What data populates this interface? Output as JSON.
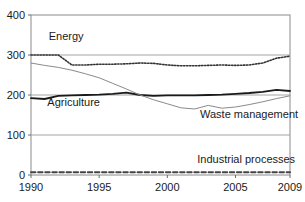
{
  "chart_data": {
    "type": "line",
    "title": "",
    "subtitle": "",
    "xlabel": "",
    "ylabel": "",
    "xlim": [
      1990,
      2009
    ],
    "ylim": [
      0,
      400
    ],
    "yticks": [
      0,
      100,
      200,
      300,
      400
    ],
    "ytick_labels": [
      "0",
      "100",
      "200",
      "300",
      "400"
    ],
    "xticks": [
      1990,
      1995,
      2000,
      2005,
      2009
    ],
    "xtick_labels": [
      "1990",
      "1995",
      "2000",
      "2005",
      "2009"
    ],
    "grid": "horizontal",
    "legend_position": "inline-annotations",
    "x": [
      1990,
      1991,
      1992,
      1993,
      1994,
      1995,
      1996,
      1997,
      1998,
      1999,
      2000,
      2001,
      2002,
      2003,
      2004,
      2005,
      2006,
      2007,
      2008,
      2009
    ],
    "series": [
      {
        "name": "Energy",
        "style": "dotted",
        "color": "#333333",
        "label_x": 1991.3,
        "label_y": 338,
        "values": [
          300,
          300,
          300,
          275,
          275,
          277,
          277,
          278,
          280,
          279,
          275,
          273,
          273,
          274,
          275,
          274,
          275,
          280,
          292,
          297
        ]
      },
      {
        "name": "Agriculture",
        "style": "solid-thick",
        "color": "#1a1a1a",
        "label_x": 1991.2,
        "label_y": 172,
        "values": [
          192,
          190,
          198,
          199,
          200,
          201,
          203,
          206,
          200,
          198,
          199,
          199,
          199,
          200,
          201,
          203,
          205,
          208,
          213,
          210
        ]
      },
      {
        "name": "Waste management",
        "style": "solid-thin",
        "color": "#8a8a8a",
        "label_x": 2002.4,
        "label_y": 143,
        "values": [
          280,
          274,
          269,
          262,
          253,
          243,
          229,
          215,
          200,
          188,
          178,
          168,
          165,
          174,
          167,
          170,
          176,
          183,
          191,
          198
        ]
      },
      {
        "name": "Industrial processes",
        "style": "dashed",
        "color": "#444444",
        "label_x": 2002.2,
        "label_y": 30,
        "values": [
          7,
          7,
          7,
          7,
          7,
          7,
          7,
          7,
          7,
          7,
          7,
          7,
          7,
          7,
          7,
          7,
          7,
          7,
          7,
          7
        ]
      }
    ]
  },
  "axes": {
    "frame_color": "#8a8a8a",
    "gridline_color": "#9a9a9a"
  }
}
